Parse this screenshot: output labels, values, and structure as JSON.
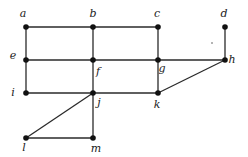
{
  "diagram": {
    "type": "graph",
    "vertices": [
      {
        "id": "a",
        "label": "a",
        "x": 26,
        "y": 27,
        "lx": 23,
        "ly": 17
      },
      {
        "id": "b",
        "label": "b",
        "x": 93,
        "y": 27,
        "lx": 93,
        "ly": 17
      },
      {
        "id": "c",
        "label": "c",
        "x": 158,
        "y": 27,
        "lx": 157,
        "ly": 17
      },
      {
        "id": "d",
        "label": "d",
        "x": 225,
        "y": 27,
        "lx": 224,
        "ly": 17
      },
      {
        "id": "e",
        "label": "e",
        "x": 26,
        "y": 60,
        "lx": 13,
        "ly": 59
      },
      {
        "id": "f",
        "label": "f",
        "x": 93,
        "y": 60,
        "lx": 98,
        "ly": 75
      },
      {
        "id": "g",
        "label": "g",
        "x": 158,
        "y": 60,
        "lx": 162,
        "ly": 72
      },
      {
        "id": "h",
        "label": "h",
        "x": 225,
        "y": 60,
        "lx": 232,
        "ly": 63
      },
      {
        "id": "i",
        "label": "i",
        "x": 26,
        "y": 93,
        "lx": 13,
        "ly": 96
      },
      {
        "id": "j",
        "label": "j",
        "x": 93,
        "y": 93,
        "lx": 99,
        "ly": 106
      },
      {
        "id": "k",
        "label": "k",
        "x": 158,
        "y": 93,
        "lx": 157,
        "ly": 108
      },
      {
        "id": "l",
        "label": "l",
        "x": 26,
        "y": 138,
        "lx": 24,
        "ly": 151
      },
      {
        "id": "m",
        "label": "m",
        "x": 93,
        "y": 138,
        "lx": 96,
        "ly": 152
      }
    ],
    "edges": [
      [
        "a",
        "b"
      ],
      [
        "b",
        "c"
      ],
      [
        "a",
        "e"
      ],
      [
        "b",
        "f"
      ],
      [
        "c",
        "g"
      ],
      [
        "d",
        "h"
      ],
      [
        "e",
        "f"
      ],
      [
        "f",
        "g"
      ],
      [
        "g",
        "h"
      ],
      [
        "e",
        "i"
      ],
      [
        "f",
        "j"
      ],
      [
        "g",
        "k"
      ],
      [
        "h",
        "k"
      ],
      [
        "i",
        "j"
      ],
      [
        "j",
        "k"
      ],
      [
        "j",
        "l"
      ],
      [
        "j",
        "m"
      ],
      [
        "l",
        "m"
      ]
    ],
    "colors": {
      "edge": "#2a2a2a",
      "vertex": "#111111",
      "label": "#222222"
    }
  }
}
